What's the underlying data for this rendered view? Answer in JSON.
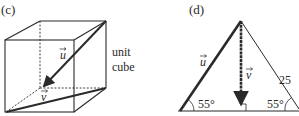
{
  "panels": {
    "c": {
      "label": "(c)",
      "vector_u": "u",
      "vector_v": "v",
      "note_line1": "unit",
      "note_line2": "cube"
    },
    "d": {
      "label": "(d)",
      "vector_u": "u",
      "vector_v": "v",
      "side_length": "25",
      "angle_left": "55°",
      "angle_right": "55°"
    }
  },
  "colors": {
    "stroke": "#2a2a2a",
    "background": "#ffffff"
  }
}
